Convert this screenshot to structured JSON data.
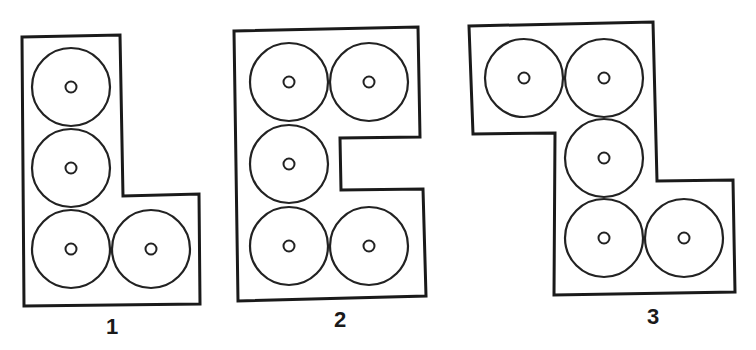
{
  "diagram": {
    "figures": [
      {
        "label": "1",
        "shape": "L-shape",
        "disc_count": 4,
        "discs_grid": [
          [
            0,
            0
          ],
          [
            0,
            1
          ],
          [
            0,
            2
          ],
          [
            1,
            2
          ]
        ]
      },
      {
        "label": "2",
        "shape": "E-shape (notched rectangle)",
        "disc_count": 5,
        "discs_grid": [
          [
            0,
            0
          ],
          [
            1,
            0
          ],
          [
            0,
            1
          ],
          [
            0,
            2
          ],
          [
            1,
            2
          ]
        ]
      },
      {
        "label": "3",
        "shape": "S/Z-shape",
        "disc_count": 5,
        "discs_grid": [
          [
            0,
            0
          ],
          [
            1,
            0
          ],
          [
            1,
            1
          ],
          [
            1,
            2
          ],
          [
            2,
            2
          ]
        ]
      }
    ]
  },
  "colors": {
    "line": "#1a1a1a",
    "background": "#ffffff"
  }
}
